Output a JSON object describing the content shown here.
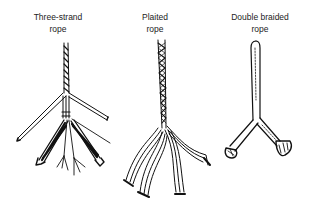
{
  "figure": {
    "ropes": [
      {
        "id": "three-strand",
        "label_line1": "Three-strand",
        "label_line2": "rope"
      },
      {
        "id": "plaited",
        "label_line1": "Plaited",
        "label_line2": "rope"
      },
      {
        "id": "double-braided",
        "label_line1": "Double braided",
        "label_line2": "rope"
      }
    ]
  },
  "colors": {
    "ink": "#111111",
    "background": "#ffffff"
  }
}
